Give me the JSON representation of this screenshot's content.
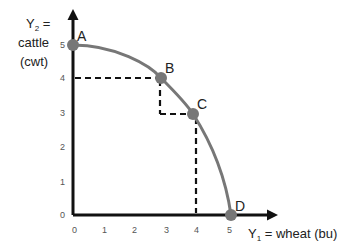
{
  "diagram": {
    "y_axis": {
      "label_line1": "Y",
      "label_sub": "2",
      "label_eq": " =",
      "label_line2": "cattle",
      "label_line3": "(cwt)",
      "ticks": [
        "0",
        "1",
        "2",
        "3",
        "4",
        "5"
      ]
    },
    "x_axis": {
      "label_main": "Y",
      "label_sub": "1",
      "label_rest": " = wheat (bu)",
      "ticks": [
        "0",
        "1",
        "2",
        "3",
        "4",
        "5"
      ]
    },
    "points": [
      {
        "label": "A",
        "x": 0,
        "y": 5
      },
      {
        "label": "B",
        "x": 2.85,
        "y": 4
      },
      {
        "label": "C",
        "x": 3.9,
        "y": 3
      },
      {
        "label": "D",
        "x": 5,
        "y": 0
      }
    ],
    "guides": [
      {
        "from": "y=4 at axis",
        "to": "B",
        "style": "dashed"
      },
      {
        "from": "B",
        "to": "(2.85,3)",
        "style": "dashed"
      },
      {
        "from": "(2.85,3)",
        "to": "C",
        "style": "dashed"
      },
      {
        "from": "C",
        "to": "x=4 at axis",
        "style": "dashed"
      }
    ],
    "colors": {
      "curve": "#777777",
      "point": "#777777",
      "axis": "#111111",
      "guide": "#111111"
    }
  }
}
